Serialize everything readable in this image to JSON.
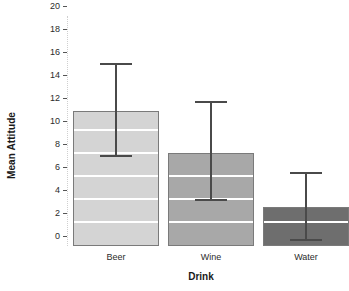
{
  "chart_data": {
    "type": "bar",
    "title": "",
    "xlabel": "Drink",
    "ylabel": "Mean Attitude",
    "categories": [
      "Beer",
      "Wine",
      "Water"
    ],
    "values": [
      11.7,
      8.1,
      3.4
    ],
    "error_upper": [
      15.7,
      12.4,
      6.3
    ],
    "error_lower": [
      7.7,
      3.9,
      0.4
    ],
    "ylim": [
      0,
      20
    ],
    "yticks": [
      0,
      2,
      4,
      6,
      8,
      10,
      12,
      14,
      16,
      18,
      20
    ],
    "ytick_labels": [
      "0",
      "2",
      "4",
      "6",
      "8",
      "10",
      "12",
      "14",
      "16",
      "18",
      "20"
    ],
    "grid": "white horizontal gridlines visible inside bars at even values",
    "legend": "none",
    "bar_colors": [
      "#d4d4d4",
      "#a8a8a8",
      "#6e6e6e"
    ],
    "bar_edge_color": "#7a7a7a",
    "error_bar_color": "#4a4a4a",
    "background_color": "#ffffff"
  },
  "axis": {
    "y_title": "Mean Attitude",
    "x_title": "Drink"
  }
}
